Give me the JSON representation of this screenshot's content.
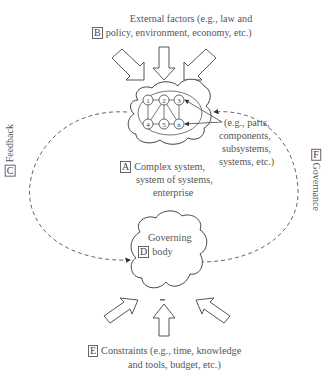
{
  "diagram": {
    "B": {
      "tag": "B",
      "line1": "External factors (e.g., law and",
      "line2": "policy, environment, economy, etc.)"
    },
    "A": {
      "tag": "A",
      "line1": "Complex system,",
      "line2": "system of systems,",
      "line3": "enterprise"
    },
    "parts_note": {
      "line1": "(e.g., parts,",
      "line2": "components,",
      "line3": "subsystems,",
      "line4": "systems, etc.)"
    },
    "nodes": [
      "1",
      "2",
      "3",
      "4",
      "5",
      "n"
    ],
    "C": {
      "tag": "C",
      "label": "Feedback"
    },
    "F": {
      "tag": "F",
      "label": "Governance"
    },
    "D": {
      "tag": "D",
      "line1": "Governing",
      "line2": "body"
    },
    "E": {
      "tag": "E",
      "line1": "Constraints (e.g., time, knowledge",
      "line2": "and tools, budget, etc.)"
    }
  }
}
